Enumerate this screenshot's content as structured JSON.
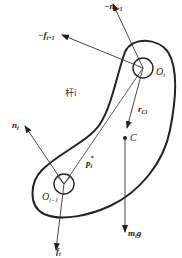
{
  "diagram": {
    "link_label": "杆i",
    "colors": {
      "stroke": "#222222",
      "background": "#ffffff"
    },
    "joints": [
      {
        "id": "O_i",
        "label": "O",
        "sub": "i",
        "cx": 143,
        "cy": 68,
        "r": 10
      },
      {
        "id": "O_i-1",
        "label": "O",
        "sub": "i−1",
        "cx": 64,
        "cy": 184,
        "r": 10
      }
    ],
    "center_of_mass": {
      "label": "C",
      "cx": 125,
      "cy": 138
    },
    "vectors": [
      {
        "id": "neg-n-i+1",
        "prefix": "−",
        "label": "n",
        "sub": "i+1",
        "from": [
          143,
          68
        ],
        "to": [
          113,
          4
        ]
      },
      {
        "id": "neg-f-i+1",
        "prefix": "−",
        "label": "f",
        "sub": "i+1",
        "from": [
          143,
          68
        ],
        "to": [
          62,
          35
        ]
      },
      {
        "id": "n-i",
        "label": "n",
        "sub": "i",
        "from": [
          64,
          184
        ],
        "to": [
          25,
          126
        ]
      },
      {
        "id": "f-i",
        "label": "f",
        "sub": "i",
        "from": [
          64,
          184
        ],
        "to": [
          56,
          250
        ]
      },
      {
        "id": "m-i-g",
        "label": "m",
        "sub": "i",
        "suffix": "g",
        "from": [
          125,
          138
        ],
        "to": [
          125,
          230
        ]
      },
      {
        "id": "r-Ci",
        "label": "r",
        "sub": "Ci",
        "from": [
          143,
          68
        ],
        "to": [
          127,
          126
        ]
      },
      {
        "id": "p-i-star",
        "label": "p",
        "sub": "i",
        "sup": "*",
        "from": [
          64,
          184
        ],
        "to": [
          143,
          68
        ]
      }
    ]
  }
}
